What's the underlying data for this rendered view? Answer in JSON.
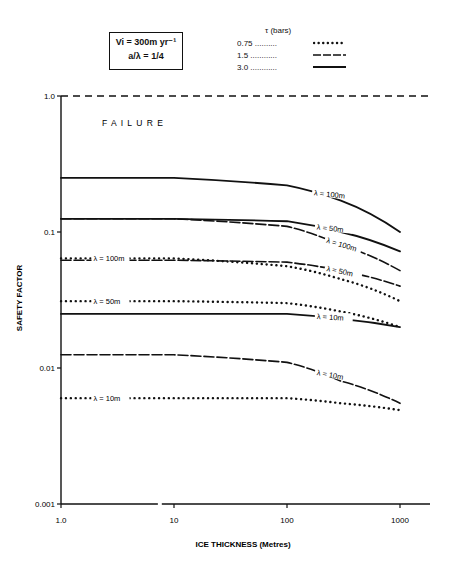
{
  "param_box": {
    "line1": "Vi = 300m yr⁻¹",
    "line2": "a/λ = 1/4"
  },
  "legend": {
    "title": "τ (bars)",
    "items": [
      {
        "label": "0.75 ..........",
        "style": "dotted"
      },
      {
        "label": "1.5 ............",
        "style": "dashed"
      },
      {
        "label": "3.0 ............",
        "style": "solid"
      }
    ]
  },
  "annotations": {
    "failure": "F A I L U R E"
  },
  "chart_data": {
    "type": "line",
    "title": "",
    "xlabel": "ICE THICKNESS (Metres)",
    "ylabel": "SAFETY FACTOR",
    "xscale": "log",
    "yscale": "log",
    "xlim": [
      1,
      2000
    ],
    "ylim": [
      0.001,
      1.0
    ],
    "xticks": [
      "1.0",
      "10",
      "100",
      "1000"
    ],
    "yticks": [
      "0.001",
      "0.01",
      "0.1",
      "1.0"
    ],
    "grid": false,
    "legend_title": "τ (bars)",
    "reference_line": {
      "y": 1.0,
      "label": "FAILURE",
      "style": "dashed"
    },
    "x": [
      1,
      10,
      100,
      300,
      1000
    ],
    "series": [
      {
        "name": "τ=3.0, λ=100m",
        "tau": 3.0,
        "lambda": "100m",
        "style": "solid",
        "values": [
          0.25,
          0.25,
          0.22,
          0.17,
          0.1
        ]
      },
      {
        "name": "τ=3.0, λ=50m",
        "tau": 3.0,
        "lambda": "50m",
        "style": "solid",
        "values": [
          0.125,
          0.125,
          0.12,
          0.1,
          0.072
        ]
      },
      {
        "name": "τ=1.5, λ=100m",
        "tau": 1.5,
        "lambda": "100m",
        "style": "dashed",
        "values": [
          0.125,
          0.125,
          0.11,
          0.08,
          0.052
        ]
      },
      {
        "name": "τ=1.5, λ=50m",
        "tau": 1.5,
        "lambda": "50m",
        "style": "dashed",
        "values": [
          0.062,
          0.062,
          0.06,
          0.052,
          0.04
        ]
      },
      {
        "name": "τ=0.75, λ=100m",
        "tau": 0.75,
        "lambda": "100m",
        "style": "dotted",
        "values": [
          0.064,
          0.064,
          0.056,
          0.045,
          0.031
        ]
      },
      {
        "name": "τ=0.75, λ=50m",
        "tau": 0.75,
        "lambda": "50m",
        "style": "dotted",
        "values": [
          0.031,
          0.031,
          0.03,
          0.026,
          0.02
        ]
      },
      {
        "name": "τ=3.0, λ=10m",
        "tau": 3.0,
        "lambda": "10m",
        "style": "solid",
        "values": [
          0.025,
          0.025,
          0.025,
          0.023,
          0.02
        ]
      },
      {
        "name": "τ=1.5, λ=10m",
        "tau": 1.5,
        "lambda": "10m",
        "style": "dashed",
        "values": [
          0.0125,
          0.0125,
          0.011,
          0.008,
          0.0055
        ]
      },
      {
        "name": "τ=0.75, λ=10m",
        "tau": 0.75,
        "lambda": "10m",
        "style": "dotted",
        "values": [
          0.006,
          0.006,
          0.006,
          0.0055,
          0.0049
        ]
      }
    ],
    "line_labels": [
      "λ = 100m",
      "λ = 50m",
      "λ = 100m",
      "λ = 50m",
      "λ = 100m",
      "λ = 50m",
      "λ = 10m",
      "λ = 10m",
      "λ = 10m"
    ]
  }
}
